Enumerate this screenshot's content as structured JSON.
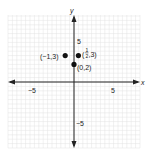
{
  "chart_data": {
    "type": "scatter",
    "title": "",
    "xlabel": "x",
    "ylabel": "y",
    "xlim": [
      -7.5,
      7.5
    ],
    "ylim": [
      -7.5,
      7.5
    ],
    "grid": true,
    "tick_labels": {
      "x": [
        "-5",
        "5"
      ],
      "y": [
        "5",
        "-5"
      ]
    },
    "points": [
      {
        "x": -1,
        "y": 3,
        "label": "(−1,3)"
      },
      {
        "x": 0.5,
        "y": 3,
        "label": "(1/2,3)"
      },
      {
        "x": 0,
        "y": 2,
        "label": "(0,2)"
      }
    ]
  },
  "labels": {
    "x_axis": "x",
    "y_axis": "y",
    "x_neg5": "−5",
    "x_pos5": "5",
    "y_pos5": "5",
    "y_neg5": "−5",
    "p1": "(−1,3)",
    "p2_open": "(",
    "p2_num": "1",
    "p2_den": "2",
    "p2_close": ",3)",
    "p3": "(0,2)"
  }
}
